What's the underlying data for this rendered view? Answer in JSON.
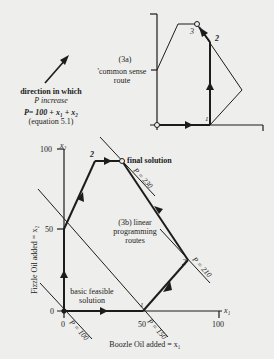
{
  "header": {
    "partial_title": ""
  },
  "legend": {
    "direction_line1": "direction in which",
    "direction_line2": "P increase",
    "equation": "P= 100 + x₁ + x₂",
    "equation_ref": "(equation 5.1)"
  },
  "diagram_a": {
    "label": "(3a)",
    "route_line1": "'common sense",
    "route_line2": "route",
    "points": [
      {
        "label": "1",
        "x": 210,
        "y": 125
      },
      {
        "label": "2",
        "x": 218,
        "y": 40
      },
      {
        "label": "3",
        "x": 197,
        "y": 24
      }
    ],
    "polygon": [
      [
        157,
        70
      ],
      [
        178,
        24
      ],
      [
        197,
        24
      ],
      [
        242,
        90
      ],
      [
        210,
        125
      ]
    ]
  },
  "diagram_b": {
    "label_line1": "(3b) linear",
    "label_line2": "programming",
    "label_line3": "routes",
    "x_axis": {
      "symbol": "x₁",
      "ticks": [
        "0",
        "50",
        "100"
      ],
      "title": "Boozle Oil added = x₁"
    },
    "y_axis": {
      "symbol": "x₂",
      "ticks": [
        "0",
        "50",
        "100"
      ],
      "title": "Fizzle Oil added = x₂"
    },
    "basic_feasible_line1": "basic feasible",
    "basic_feasible_line2": "solution",
    "final_solution": "final solution",
    "point_labels": {
      "p1": "1",
      "p2_left": "2",
      "p2_right": "2"
    },
    "iso_profit": [
      {
        "label": "P = 100"
      },
      {
        "label": "P = 150"
      },
      {
        "label": "P = 210"
      },
      {
        "label": "P = 230"
      }
    ]
  }
}
